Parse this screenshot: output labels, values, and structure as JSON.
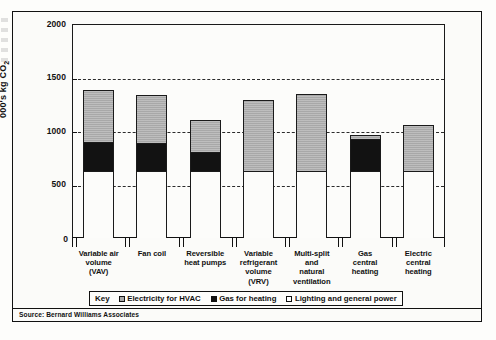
{
  "chart_data": {
    "type": "bar",
    "subtype": "stacked-bar",
    "title": "",
    "xlabel": "",
    "ylabel": "000's kg CO2",
    "ylabel_html": "000's kg CO<sub>2</sub>",
    "ylim": [
      0,
      2000
    ],
    "yticks": [
      0,
      500,
      1000,
      1500,
      2000
    ],
    "ytick_labels": [
      "0",
      "500",
      "1000",
      "1500",
      "2000"
    ],
    "grid": true,
    "grid_style": "dashed horizontal",
    "legend_position": "below-axis",
    "categories": [
      "Variable air volume (VAV)",
      "Fan coil",
      "Reversible heat pumps",
      "Variable refrigerant volume (VRV)",
      "Multi-split and natural ventilation",
      "Gas central heating",
      "Electric central heating"
    ],
    "category_lines": [
      [
        "Variable air",
        "volume",
        "(VAV)"
      ],
      [
        "Fan coil"
      ],
      [
        "Reversible",
        "heat pumps"
      ],
      [
        "Variable",
        "refrigerant",
        "volume",
        "(VRV)"
      ],
      [
        "Multi-split",
        "and",
        "natural",
        "ventilation"
      ],
      [
        "Gas",
        "central",
        "heating"
      ],
      [
        "Electric",
        "central",
        "heating"
      ]
    ],
    "series": [
      {
        "name": "Lighting and general power",
        "color": "#ffffff",
        "values": [
          620,
          620,
          620,
          620,
          620,
          620,
          620
        ]
      },
      {
        "name": "Gas for heating",
        "color": "#121212",
        "values": [
          265,
          255,
          170,
          0,
          0,
          300,
          0
        ]
      },
      {
        "name": "Electricity for HVAC",
        "color": "#a8a8a8",
        "values": [
          500,
          465,
          310,
          670,
          730,
          40,
          440
        ]
      }
    ],
    "totals": [
      1385,
      1340,
      1100,
      1290,
      1350,
      960,
      1060
    ]
  },
  "legend": {
    "key_label": "Key",
    "items": [
      {
        "label": "Electricity for HVAC",
        "swatch": "grey"
      },
      {
        "label": "Gas for heating",
        "swatch": "black"
      },
      {
        "label": "Lighting and general power",
        "swatch": "white"
      }
    ]
  },
  "source": {
    "text": "Source: Bernard Williams Associates"
  }
}
